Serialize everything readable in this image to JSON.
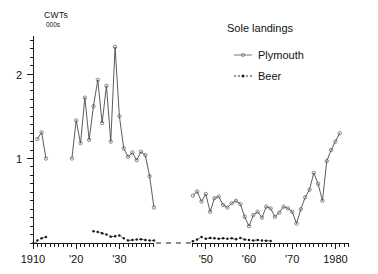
{
  "chart_data": {
    "type": "line",
    "title": "Sole  landings",
    "xlabel": "",
    "ylabel": "CWTs 000s",
    "ylabel_line1": "CWTs",
    "ylabel_line2": "000s",
    "ylim": [
      0,
      2.45
    ],
    "xlim": [
      1909,
      1983
    ],
    "grid": false,
    "legend_position": "top-right",
    "y_major_ticks": [
      1,
      2
    ],
    "y_major_tick_labels": [
      "1",
      "2"
    ],
    "y_minor_tick_step": 0.1,
    "x_major_ticks": [
      1910,
      1920,
      1930,
      1950,
      1960,
      1970,
      1980
    ],
    "x_major_tick_labels": [
      "1910",
      "'20",
      "'30",
      "'50",
      "'60",
      "'70",
      "1980"
    ],
    "x_minor_tick_step": 1,
    "axis_break": true,
    "axis_break_range": [
      1938,
      1947
    ],
    "series": [
      {
        "name": "Plymouth",
        "style": "solid-with-open-circle-markers",
        "color": "#4a4a4a",
        "segments": [
          {
            "x": [
              1911,
              1912,
              1913
            ],
            "values": [
              1.23,
              1.31,
              1.0
            ]
          },
          {
            "x": [
              1919,
              1920,
              1921,
              1922,
              1923,
              1924,
              1925,
              1926,
              1927,
              1928,
              1929,
              1930,
              1931,
              1932,
              1933,
              1934,
              1935,
              1936,
              1937,
              1938
            ],
            "values": [
              1.0,
              1.45,
              1.18,
              1.72,
              1.22,
              1.62,
              1.93,
              1.42,
              1.86,
              1.2,
              2.32,
              1.5,
              1.12,
              1.02,
              1.07,
              0.98,
              1.08,
              1.04,
              0.79,
              0.42
            ]
          },
          {
            "x": [
              1947,
              1948,
              1949,
              1950,
              1951,
              1952,
              1953,
              1954,
              1955,
              1956,
              1957,
              1958,
              1959,
              1960,
              1961,
              1962,
              1963,
              1964,
              1965,
              1966,
              1967,
              1968,
              1969,
              1970,
              1971,
              1972,
              1973,
              1974,
              1975,
              1976,
              1977,
              1978,
              1979,
              1980,
              1981
            ],
            "values": [
              0.56,
              0.61,
              0.49,
              0.58,
              0.37,
              0.53,
              0.55,
              0.45,
              0.42,
              0.47,
              0.5,
              0.46,
              0.31,
              0.2,
              0.33,
              0.37,
              0.3,
              0.43,
              0.41,
              0.31,
              0.36,
              0.43,
              0.41,
              0.37,
              0.23,
              0.4,
              0.54,
              0.63,
              0.83,
              0.7,
              0.5,
              0.97,
              1.1,
              1.2,
              1.3
            ]
          }
        ]
      },
      {
        "name": "Beer",
        "style": "dotted-with-filled-markers",
        "color": "#1a1a1a",
        "segments": [
          {
            "x": [
              1911,
              1912,
              1913
            ],
            "values": [
              0.03,
              0.055,
              0.07
            ]
          },
          {
            "x": [
              1924,
              1925,
              1926,
              1927,
              1928,
              1929,
              1930,
              1931,
              1932,
              1933,
              1934,
              1935,
              1936,
              1937,
              1938
            ],
            "values": [
              0.14,
              0.13,
              0.115,
              0.1,
              0.075,
              0.08,
              0.09,
              0.055,
              0.03,
              0.035,
              0.04,
              0.045,
              0.035,
              0.03,
              0.03
            ]
          },
          {
            "x": [
              1947,
              1948,
              1949,
              1950,
              1951,
              1952,
              1953,
              1954,
              1955,
              1956,
              1957,
              1958,
              1959,
              1960,
              1961,
              1962,
              1963,
              1964,
              1965
            ],
            "values": [
              0.02,
              0.04,
              0.07,
              0.05,
              0.06,
              0.055,
              0.05,
              0.055,
              0.05,
              0.055,
              0.045,
              0.06,
              0.04,
              0.035,
              0.03,
              0.035,
              0.03,
              0.028,
              0.025
            ]
          }
        ]
      }
    ]
  },
  "legend": {
    "title": "Sole  landings",
    "items": [
      {
        "label": "Plymouth",
        "marker": "solid-line"
      },
      {
        "label": "Beer",
        "marker": "dotted-line"
      }
    ]
  },
  "yaxis": {
    "title_line1": "CWTs",
    "title_line2": "000s",
    "labels": [
      "2",
      "1"
    ]
  },
  "xaxis": {
    "labels": [
      "1910",
      "'20",
      "'30",
      "'50",
      "'60",
      "'70",
      "1980"
    ]
  }
}
